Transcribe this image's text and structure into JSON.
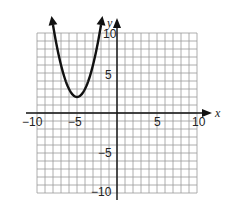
{
  "chart_data": {
    "type": "line",
    "title": "",
    "xlabel": "x",
    "ylabel": "y",
    "xlim": [
      -10,
      10
    ],
    "ylim": [
      -10,
      10
    ],
    "grid": true,
    "x_ticks": [
      -10,
      -5,
      5,
      10
    ],
    "y_ticks": [
      10,
      5,
      -5,
      -10
    ],
    "x_tick_labels": [
      "−10",
      "−5",
      "5",
      "10"
    ],
    "y_tick_labels": [
      "10",
      "5",
      "−5",
      "−10"
    ],
    "series": [
      {
        "name": "parabola",
        "equation": "y = (x + 5)^2 + 2",
        "vertex": [
          -5,
          2
        ],
        "x": [
          -8.1,
          -8,
          -7,
          -6,
          -5,
          -4,
          -3,
          -2,
          -1.9
        ],
        "values": [
          11.61,
          11,
          6,
          3,
          2,
          3,
          6,
          11,
          11.61
        ],
        "arrows_on_ends": true
      }
    ]
  },
  "labels": {
    "x_axis": "x",
    "y_axis": "y",
    "xt_m10": "−10",
    "xt_m5": "−5",
    "xt_5": "5",
    "xt_10": "10",
    "yt_10": "10",
    "yt_5": "5",
    "yt_m5": "−5",
    "yt_m10": "−10"
  }
}
